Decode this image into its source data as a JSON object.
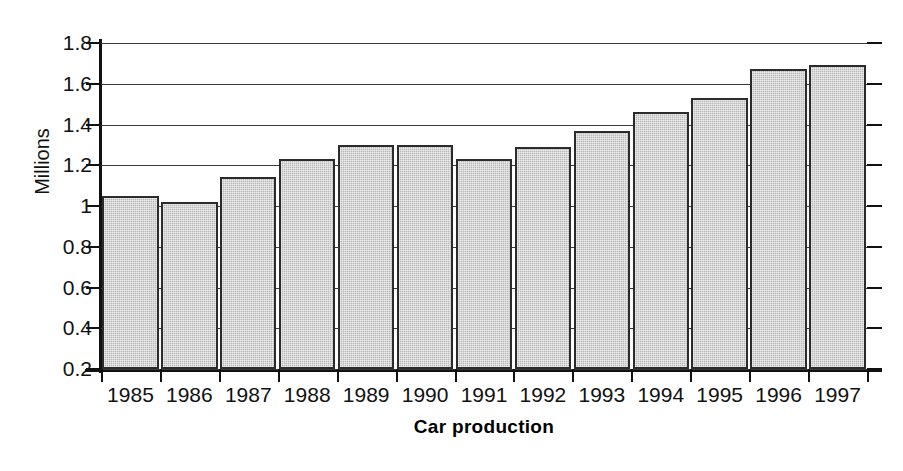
{
  "chart_data": {
    "type": "bar",
    "title": "",
    "xlabel": "Car production",
    "ylabel": "Millions",
    "categories": [
      "1985",
      "1986",
      "1987",
      "1988",
      "1989",
      "1990",
      "1991",
      "1992",
      "1993",
      "1994",
      "1995",
      "1996",
      "1997"
    ],
    "values": [
      1.05,
      1.02,
      1.14,
      1.23,
      1.3,
      1.3,
      1.23,
      1.29,
      1.37,
      1.46,
      1.53,
      1.67,
      1.69
    ],
    "series": [
      {
        "name": "Car production",
        "values": [
          1.05,
          1.02,
          1.14,
          1.23,
          1.3,
          1.3,
          1.23,
          1.29,
          1.37,
          1.46,
          1.53,
          1.67,
          1.69
        ]
      }
    ],
    "ylim": [
      0.2,
      1.8
    ],
    "ytick_labels": [
      "1.8",
      "1.6",
      "1.4",
      "1.2",
      "1",
      "0.8",
      "0.6",
      "0.4",
      "0.2"
    ],
    "ytick_values": [
      1.8,
      1.6,
      1.4,
      1.2,
      1.0,
      0.8,
      0.6,
      0.4,
      0.2
    ],
    "grid": true,
    "legend": "none",
    "bar_fill_color": "#b9b9b9",
    "bar_border_color": "#2b2b2b",
    "axis_color": "#111111",
    "gridline_color": "#3a3a3a",
    "background_color": "#ffffff"
  },
  "axes": {
    "y_title": "Millions",
    "x_title": "Car production"
  }
}
